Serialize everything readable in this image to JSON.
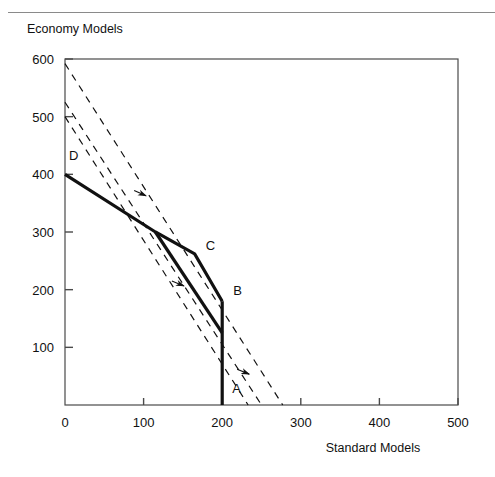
{
  "figure": {
    "top_rule": true,
    "background": "#ffffff",
    "line_color": "#111111",
    "axis_color": "#4a4a4a"
  },
  "chart_data": {
    "type": "line",
    "title": "",
    "xlabel": "Standard Models",
    "ylabel": "Economy Models",
    "xlim": [
      0,
      500
    ],
    "ylim": [
      0,
      600
    ],
    "xticks": [
      0,
      100,
      200,
      300,
      400,
      500
    ],
    "yticks": [
      0,
      100,
      200,
      300,
      400,
      500,
      600
    ],
    "xtick_labels": [
      "0",
      "100",
      "200",
      "300",
      "400",
      "500"
    ],
    "ytick_labels": [
      "0",
      "100",
      "200",
      "300",
      "400",
      "500",
      "600"
    ],
    "grid": false,
    "legend": false,
    "series": [
      {
        "name": "production-possibility-frontier-outer",
        "style": "solid",
        "width": 3.2,
        "points": [
          [
            0,
            400
          ],
          [
            115,
            300
          ],
          [
            165,
            262
          ],
          [
            200,
            180
          ]
        ]
      },
      {
        "name": "production-possibility-frontier-inner",
        "style": "solid",
        "width": 3.2,
        "points": [
          [
            115,
            300
          ],
          [
            200,
            125
          ]
        ]
      },
      {
        "name": "capacity-constraint-vertical",
        "style": "solid",
        "width": 3.2,
        "points": [
          [
            200,
            180
          ],
          [
            200,
            0
          ]
        ]
      },
      {
        "name": "isoprofit-line-1",
        "style": "dashed",
        "width": 1.2,
        "points": [
          [
            0,
            592
          ],
          [
            277,
            0
          ]
        ]
      },
      {
        "name": "isoprofit-line-2",
        "style": "dashed",
        "width": 1.2,
        "points": [
          [
            0,
            525
          ],
          [
            250,
            0
          ]
        ]
      },
      {
        "name": "isoprofit-line-3",
        "style": "dashed",
        "width": 1.2,
        "points": [
          [
            0,
            500
          ],
          [
            233,
            0
          ]
        ]
      }
    ],
    "annotations": [
      {
        "label": "D",
        "x": 0,
        "y": 400,
        "dx": 4,
        "dy": -14
      },
      {
        "label": "C",
        "x": 165,
        "y": 262,
        "dx": 11,
        "dy": -4
      },
      {
        "label": "B",
        "x": 200,
        "y": 180,
        "dx": 11,
        "dy": -6
      },
      {
        "label": "A",
        "x": 200,
        "y": 0,
        "dx": 10,
        "dy": -12
      }
    ],
    "direction_arrows": [
      {
        "name": "arrow-upper",
        "x": 88,
        "y": 372,
        "angle": 24
      },
      {
        "name": "arrow-middle",
        "x": 136,
        "y": 215,
        "angle": 22
      },
      {
        "name": "arrow-lower",
        "x": 219,
        "y": 62,
        "angle": 22
      }
    ]
  }
}
